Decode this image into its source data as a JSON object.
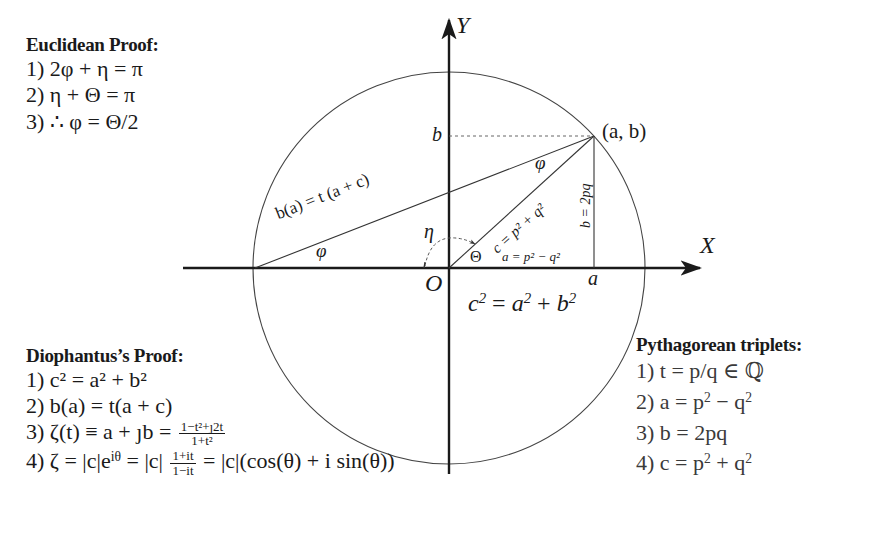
{
  "diagram": {
    "axes": {
      "x_label": "X",
      "y_label": "Y",
      "origin_label": "O"
    },
    "circle": {
      "center": [
        449,
        268
      ],
      "radius": 196
    },
    "point_label": "(a, b)",
    "tick_labels": {
      "a": "a",
      "b": "b"
    },
    "segment_labels": {
      "chord": "b(a) = t (a + c)",
      "hypotenuse": "c = p² + q²",
      "vertical_leg": "b = 2pq",
      "horizontal_leg": "a = p² − q²"
    },
    "angle_labels": {
      "phi_left": "φ",
      "phi_top": "φ",
      "eta": "η",
      "theta": "Θ"
    },
    "main_equation": "c² = a² + b²",
    "colors": {
      "line": "#1a1a1a",
      "thin": "#333333",
      "background": "#ffffff"
    }
  },
  "euclidean": {
    "heading": "Euclidean Proof:",
    "items": [
      {
        "num": "1)",
        "expr": "2φ + η = π"
      },
      {
        "num": "2)",
        "expr": "η + Θ = π"
      },
      {
        "num": "3)",
        "expr": "∴ φ = Θ/2"
      }
    ]
  },
  "diophantus": {
    "heading": "Diophantus’s Proof:",
    "items": [
      {
        "num": "1)",
        "expr": "c² = a² + b²"
      },
      {
        "num": "2)",
        "expr": "b(a) = t(a + c)"
      },
      {
        "num": "3)",
        "expr_left": "ζ(t) ≡ a + ȷb =",
        "frac_num": "1−t²+ȷ2t",
        "frac_den": "1+t²"
      },
      {
        "num": "4)",
        "expr_left": "ζ = |c|e",
        "exp": "iθ",
        "expr_mid": " = |c|",
        "frac_num": "1+it",
        "frac_den": "1−it",
        "expr_right": " = |c|(cos(θ) + i sin(θ))"
      }
    ]
  },
  "pythagorean": {
    "heading": "Pythagorean triplets:",
    "items": [
      {
        "num": "1)",
        "expr": "t = p/q ∈ ℚ"
      },
      {
        "num": "2)",
        "expr_base": "a = p",
        "expr_tail": " − q"
      },
      {
        "num": "3)",
        "expr": "b = 2pq"
      },
      {
        "num": "4)",
        "expr_base": "c = p",
        "expr_tail": " + q"
      }
    ]
  }
}
